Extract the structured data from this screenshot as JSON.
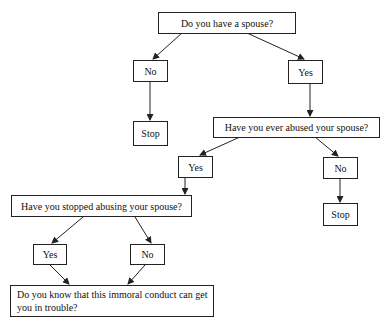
{
  "diagram": {
    "type": "flowchart",
    "nodes": {
      "q1": "Do you have a spouse?",
      "q1_no": "No",
      "q1_no_stop": "Stop",
      "q1_yes": "Yes",
      "q2": "Have you ever abused your spouse?",
      "q2_yes": "Yes",
      "q2_no": "No",
      "q2_no_stop": "Stop",
      "q3": "Have you stopped abusing your spouse?",
      "q3_yes": "Yes",
      "q3_no": "No",
      "q4": "Do you know that this immoral conduct can get you in trouble?"
    },
    "edges": [
      [
        "q1",
        "q1_no"
      ],
      [
        "q1",
        "q1_yes"
      ],
      [
        "q1_no",
        "q1_no_stop"
      ],
      [
        "q1_yes",
        "q2"
      ],
      [
        "q2",
        "q2_yes"
      ],
      [
        "q2",
        "q2_no"
      ],
      [
        "q2_no",
        "q2_no_stop"
      ],
      [
        "q2_yes",
        "q3"
      ],
      [
        "q3",
        "q3_yes"
      ],
      [
        "q3",
        "q3_no"
      ],
      [
        "q3_yes",
        "q4"
      ],
      [
        "q3_no",
        "q4"
      ]
    ],
    "colors": {
      "line": "#222222",
      "background": "#ffffff"
    }
  }
}
